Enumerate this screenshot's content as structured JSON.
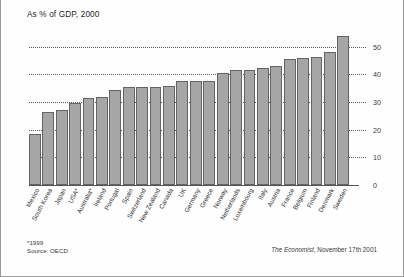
{
  "figure": {
    "title": "As % of GDP, 2000",
    "footnote_asterisk": "*1999",
    "footnote_source": "Source: OECD",
    "credit_publication": "The Economist",
    "credit_date": ", November 17th 2001",
    "bar_color": "#a6a6a6",
    "bar_border_color": "#646464",
    "frame_color": "#9a9a9a"
  },
  "chart_data": {
    "type": "bar",
    "title": "As % of GDP, 2000",
    "xlabel": "",
    "ylabel": "",
    "ylim": [
      0,
      55
    ],
    "yticks": [
      0,
      10,
      20,
      30,
      40,
      50
    ],
    "ytick_labels": [
      "0",
      "10",
      "20",
      "30",
      "40",
      "50"
    ],
    "grid": true,
    "grid_style": "dotted-horizontal",
    "legend": "none",
    "orientation": "vertical",
    "sorted": "ascending",
    "categories": [
      "Mexico",
      "South Korea",
      "Japan",
      "USA*",
      "Australia*",
      "Ireland",
      "Portugal",
      "Spain",
      "Switzerland",
      "New Zealand",
      "Canada",
      "UK",
      "Germany",
      "Greece",
      "Norway",
      "Netherlands",
      "Luxembourg",
      "Italy",
      "Austria",
      "France",
      "Belgium",
      "Finland",
      "Denmark",
      "Sweden"
    ],
    "values": [
      18.5,
      26.5,
      27.0,
      29.5,
      31.5,
      32.0,
      34.5,
      35.5,
      35.5,
      35.5,
      36.0,
      37.5,
      37.5,
      37.5,
      40.5,
      41.5,
      41.5,
      42.5,
      43.0,
      45.5,
      46.0,
      46.5,
      48.0,
      54.0
    ],
    "annotations": [
      "*1999",
      "Source: OECD",
      "The Economist, November 17th 2001"
    ]
  }
}
